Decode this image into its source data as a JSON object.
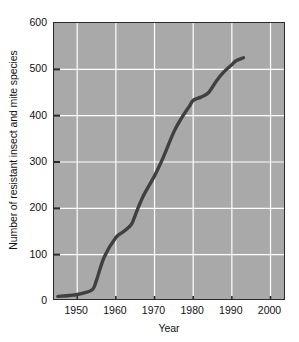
{
  "chart_data": {
    "type": "line",
    "title": "",
    "xlabel": "Year",
    "ylabel": "Number of resistant insect and mite species",
    "xlim": [
      1944,
      2004
    ],
    "ylim": [
      0,
      600
    ],
    "xticks": [
      "1950",
      "1960",
      "1970",
      "1980",
      "1990",
      "2000"
    ],
    "xtick_values": [
      1950,
      1960,
      1970,
      1980,
      1990,
      2000
    ],
    "yticks": [
      "0",
      "100",
      "200",
      "300",
      "400",
      "500",
      "600"
    ],
    "ytick_values": [
      0,
      100,
      200,
      300,
      400,
      500,
      600
    ],
    "grid": true,
    "grid_color": "#ffffff",
    "plot_background": "#a9a9a9",
    "line_color": "#404040",
    "legend": null,
    "series": [
      {
        "name": "Resistant insect and mite species",
        "x": [
          1945,
          1948,
          1950,
          1952,
          1954,
          1955,
          1957,
          1960,
          1962,
          1964,
          1965,
          1967,
          1970,
          1972,
          1975,
          1977,
          1979,
          1980,
          1982,
          1984,
          1986,
          1988,
          1990,
          1991,
          1993
        ],
        "values": [
          10,
          12,
          14,
          18,
          25,
          45,
          95,
          137,
          150,
          165,
          185,
          225,
          270,
          305,
          365,
          395,
          420,
          433,
          440,
          450,
          475,
          495,
          510,
          518,
          525
        ]
      }
    ]
  },
  "axes": {
    "x_title": "Year",
    "y_title": "Number of resistant insect and mite species"
  }
}
